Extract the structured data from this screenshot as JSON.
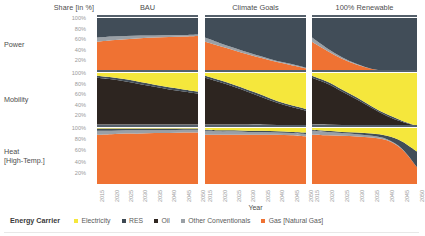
{
  "header": {
    "y_axis_title": "Share [in %]",
    "x_axis_title": "Year"
  },
  "columns": [
    {
      "label": "BAU"
    },
    {
      "label": "Climate Goals"
    },
    {
      "label": "100% Renewable"
    }
  ],
  "rows": [
    {
      "label": "Power",
      "label2": ""
    },
    {
      "label": "Mobility",
      "label2": ""
    },
    {
      "label": "Heat",
      "label2": "[High-Temp.]"
    }
  ],
  "y_ticks": [
    "100%",
    "80%",
    "60%",
    "40%",
    "20%"
  ],
  "x_ticks": [
    "2015",
    "2020",
    "2025",
    "2030",
    "2035",
    "2040",
    "2045",
    "2050"
  ],
  "legend": {
    "title": "Energy Carrier",
    "items": [
      {
        "label": "Electricity",
        "color": "#f5e73c"
      },
      {
        "label": "RES",
        "color": "#3d4852"
      },
      {
        "label": "Oil",
        "color": "#2f2620"
      },
      {
        "label": "Other Conventionals",
        "color": "#9aa0a6"
      },
      {
        "label": "Gas [Natural Gas]",
        "color": "#ef7233"
      }
    ]
  },
  "colors": {
    "electricity": "#f5e73c",
    "res": "#414d58",
    "oil": "#2d2520",
    "other_conventionals": "#9aa0a6",
    "gas": "#ef7233",
    "panel_rule": "#55606b",
    "tick_text": "#9a9a9a",
    "label_text": "#4d4d4d"
  },
  "chart_data": {
    "type": "area",
    "title": "",
    "xlabel": "Year",
    "ylabel": "Share [in %]",
    "ylim": [
      0,
      100
    ],
    "x": [
      2015,
      2020,
      2025,
      2030,
      2035,
      2040,
      2045,
      2050
    ],
    "grid": false,
    "legend_position": "bottom",
    "stack_order": [
      "Gas [Natural Gas]",
      "Other Conventionals",
      "Oil",
      "RES",
      "Electricity"
    ],
    "panels": [
      {
        "scenario": "BAU",
        "sector": "Power",
        "series": [
          {
            "name": "Gas [Natural Gas]",
            "values": [
              55,
              58,
              60,
              62,
              63,
              64,
              65,
              66
            ]
          },
          {
            "name": "Other Conventionals",
            "values": [
              8,
              7,
              6,
              5,
              4,
              4,
              3,
              3
            ]
          },
          {
            "name": "Oil",
            "values": [
              0,
              0,
              0,
              0,
              0,
              0,
              0,
              0
            ]
          },
          {
            "name": "RES",
            "values": [
              37,
              35,
              34,
              33,
              33,
              32,
              32,
              31
            ]
          },
          {
            "name": "Electricity",
            "values": [
              0,
              0,
              0,
              0,
              0,
              0,
              0,
              0
            ]
          }
        ]
      },
      {
        "scenario": "BAU",
        "sector": "Mobility",
        "series": [
          {
            "name": "Gas [Natural Gas]",
            "values": [
              1,
              1,
              1,
              1,
              1,
              1,
              1,
              1
            ]
          },
          {
            "name": "Other Conventionals",
            "values": [
              2,
              2,
              2,
              2,
              2,
              2,
              2,
              2
            ]
          },
          {
            "name": "Oil",
            "values": [
              88,
              85,
              81,
              76,
              71,
              66,
              62,
              58
            ]
          },
          {
            "name": "RES",
            "values": [
              4,
              4,
              4,
              4,
              4,
              4,
              4,
              4
            ]
          },
          {
            "name": "Electricity",
            "values": [
              5,
              8,
              12,
              17,
              22,
              27,
              31,
              35
            ]
          }
        ]
      },
      {
        "scenario": "BAU",
        "sector": "Heat [High-Temp.]",
        "series": [
          {
            "name": "Gas [Natural Gas]",
            "values": [
              88,
              89,
              90,
              90,
              91,
              91,
              92,
              92
            ]
          },
          {
            "name": "Other Conventionals",
            "values": [
              7,
              6,
              6,
              6,
              5,
              5,
              5,
              5
            ]
          },
          {
            "name": "Oil",
            "values": [
              0,
              0,
              0,
              0,
              0,
              0,
              0,
              0
            ]
          },
          {
            "name": "RES",
            "values": [
              4,
              4,
              3,
              3,
              3,
              3,
              2,
              2
            ]
          },
          {
            "name": "Electricity",
            "values": [
              1,
              1,
              1,
              1,
              1,
              1,
              1,
              1
            ]
          }
        ]
      },
      {
        "scenario": "Climate Goals",
        "sector": "Power",
        "series": [
          {
            "name": "Gas [Natural Gas]",
            "values": [
              55,
              47,
              39,
              31,
              24,
              17,
              11,
              5
            ]
          },
          {
            "name": "Other Conventionals",
            "values": [
              8,
              6,
              5,
              4,
              3,
              2,
              2,
              1
            ]
          },
          {
            "name": "Oil",
            "values": [
              0,
              0,
              0,
              0,
              0,
              0,
              0,
              0
            ]
          },
          {
            "name": "RES",
            "values": [
              37,
              47,
              56,
              65,
              73,
              81,
              87,
              94
            ]
          },
          {
            "name": "Electricity",
            "values": [
              0,
              0,
              0,
              0,
              0,
              0,
              0,
              0
            ]
          }
        ]
      },
      {
        "scenario": "Climate Goals",
        "sector": "Mobility",
        "series": [
          {
            "name": "Gas [Natural Gas]",
            "values": [
              1,
              1,
              1,
              1,
              1,
              1,
              1,
              1
            ]
          },
          {
            "name": "Other Conventionals",
            "values": [
              2,
              2,
              2,
              2,
              2,
              1,
              1,
              1
            ]
          },
          {
            "name": "Oil",
            "values": [
              88,
              80,
              71,
              61,
              51,
              42,
              34,
              27
            ]
          },
          {
            "name": "RES",
            "values": [
              4,
              4,
              4,
              4,
              4,
              3,
              3,
              3
            ]
          },
          {
            "name": "Electricity",
            "values": [
              5,
              13,
              22,
              32,
              42,
              53,
              61,
              68
            ]
          }
        ]
      },
      {
        "scenario": "Climate Goals",
        "sector": "Heat [High-Temp.]",
        "series": [
          {
            "name": "Gas [Natural Gas]",
            "values": [
              88,
              88,
              88,
              88,
              88,
              88,
              87,
              85
            ]
          },
          {
            "name": "Other Conventionals",
            "values": [
              7,
              6,
              6,
              5,
              5,
              4,
              4,
              4
            ]
          },
          {
            "name": "Oil",
            "values": [
              0,
              0,
              0,
              0,
              0,
              0,
              0,
              0
            ]
          },
          {
            "name": "RES",
            "values": [
              2,
              2,
              2,
              2,
              2,
              2,
              2,
              3
            ]
          },
          {
            "name": "Electricity",
            "values": [
              3,
              4,
              4,
              5,
              5,
              6,
              7,
              8
            ]
          }
        ]
      },
      {
        "scenario": "100% Renewable",
        "sector": "Power",
        "series": [
          {
            "name": "Gas [Natural Gas]",
            "values": [
              55,
              38,
              23,
              12,
              4,
              0,
              0,
              0
            ]
          },
          {
            "name": "Other Conventionals",
            "values": [
              8,
              5,
              3,
              1,
              0,
              0,
              0,
              0
            ]
          },
          {
            "name": "Oil",
            "values": [
              0,
              0,
              0,
              0,
              0,
              0,
              0,
              0
            ]
          },
          {
            "name": "RES",
            "values": [
              37,
              57,
              74,
              87,
              96,
              100,
              100,
              100
            ]
          },
          {
            "name": "Electricity",
            "values": [
              0,
              0,
              0,
              0,
              0,
              0,
              0,
              0
            ]
          }
        ]
      },
      {
        "scenario": "100% Renewable",
        "sector": "Mobility",
        "series": [
          {
            "name": "Gas [Natural Gas]",
            "values": [
              1,
              1,
              1,
              1,
              0,
              0,
              0,
              0
            ]
          },
          {
            "name": "Other Conventionals",
            "values": [
              2,
              2,
              1,
              1,
              1,
              0,
              0,
              0
            ]
          },
          {
            "name": "Oil",
            "values": [
              88,
              77,
              63,
              48,
              33,
              19,
              8,
              0
            ]
          },
          {
            "name": "RES",
            "values": [
              4,
              4,
              4,
              4,
              3,
              3,
              2,
              0
            ]
          },
          {
            "name": "Electricity",
            "values": [
              5,
              16,
              31,
              46,
              63,
              78,
              90,
              100
            ]
          }
        ]
      },
      {
        "scenario": "100% Renewable",
        "sector": "Heat [High-Temp.]",
        "series": [
          {
            "name": "Gas [Natural Gas]",
            "values": [
              88,
              87,
              86,
              85,
              83,
              78,
              62,
              30
            ]
          },
          {
            "name": "Other Conventionals",
            "values": [
              7,
              6,
              5,
              4,
              3,
              2,
              1,
              0
            ]
          },
          {
            "name": "Oil",
            "values": [
              0,
              0,
              0,
              0,
              0,
              0,
              0,
              0
            ]
          },
          {
            "name": "RES",
            "values": [
              2,
              2,
              2,
              3,
              4,
              6,
              13,
              28
            ]
          },
          {
            "name": "Electricity",
            "values": [
              3,
              5,
              7,
              8,
              10,
              14,
              24,
              42
            ]
          }
        ]
      }
    ]
  }
}
